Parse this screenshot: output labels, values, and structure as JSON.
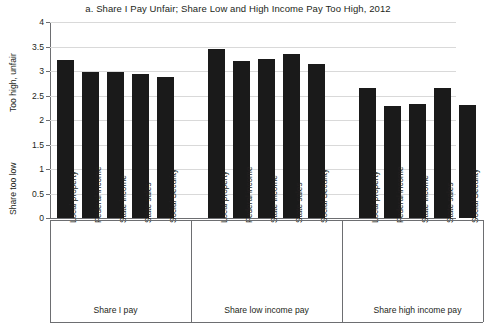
{
  "chart_data": {
    "type": "bar",
    "title": "a. Share I Pay Unfair; Share Low and High Income Pay Too High, 2012",
    "xlabel": "",
    "ylabel_top": "Too high, unfair",
    "ylabel_bottom": "Share too low",
    "ylim": [
      0,
      4
    ],
    "ytick_labels": [
      "4",
      "3.5",
      "3",
      "2.5",
      "2",
      "1.5",
      "1",
      "0.5",
      "0"
    ],
    "ytick_values": [
      4,
      3.5,
      3,
      2.5,
      2,
      1.5,
      1,
      0.5,
      0
    ],
    "grid": true,
    "legend": "none",
    "categories": [
      "Local property",
      "Federal income",
      "State income",
      "State sales",
      "Social Security"
    ],
    "groups": [
      {
        "name": "Share I pay",
        "values": [
          3.22,
          2.99,
          2.97,
          2.94,
          2.88
        ]
      },
      {
        "name": "Share low income pay",
        "values": [
          3.45,
          3.21,
          3.24,
          3.35,
          3.15
        ]
      },
      {
        "name": "Share high income pay",
        "values": [
          2.66,
          2.28,
          2.32,
          2.66,
          2.3
        ]
      }
    ],
    "bar_color": "#1a1a1a"
  }
}
